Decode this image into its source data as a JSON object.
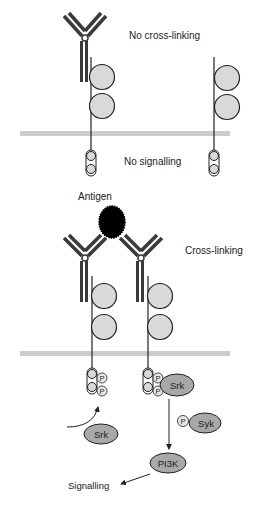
{
  "top_panel": {
    "state_label": "No cross-linking",
    "outcome_label": "No signalling"
  },
  "bottom_panel": {
    "antigen_label": "Antigen",
    "state_label": "Cross-linking",
    "outcome_label": "Signalling",
    "phospho_label": "P",
    "kinases": {
      "srk_bound": "Srk",
      "srk_free": "Srk",
      "syk": "Syk",
      "pi3k": "PI3K"
    }
  },
  "colors": {
    "antibody": "#3a3a3a",
    "domain_fill": "#d9d9d9",
    "membrane": "#cccccc",
    "kinase_fill": "#a8a8a8",
    "antigen": "#000000",
    "line": "#222222"
  }
}
